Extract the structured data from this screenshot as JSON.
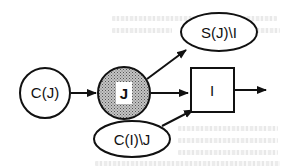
{
  "diagram": {
    "type": "flow-diagram",
    "colors": {
      "stroke": "#111111",
      "background": "#ffffff",
      "shaded_fill": "#a8a8a8",
      "label_box_fill": "#ffffff"
    },
    "nodes": [
      {
        "id": "cj",
        "shape": "circle",
        "label": "C(J)"
      },
      {
        "id": "j",
        "shape": "circle-shaded",
        "label": "J"
      },
      {
        "id": "sji",
        "shape": "ellipse",
        "label": "S(J)\\I"
      },
      {
        "id": "i",
        "shape": "rectangle",
        "label": "I"
      },
      {
        "id": "cij",
        "shape": "ellipse",
        "label": "C(I)\\J"
      }
    ],
    "edges": [
      {
        "from": "C(J)",
        "to": "J"
      },
      {
        "from": "J",
        "to": "S(J)\\I"
      },
      {
        "from": "J",
        "to": "I"
      },
      {
        "from": "C(I)\\J",
        "to": "I"
      },
      {
        "from": "I",
        "to": "output"
      }
    ]
  }
}
